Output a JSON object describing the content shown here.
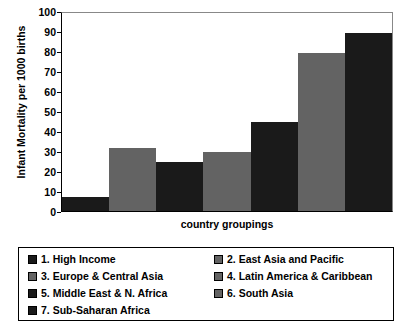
{
  "chart_data": {
    "type": "bar",
    "title": "",
    "xlabel": "country groupings",
    "ylabel": "Infant Mortality per 1000 births",
    "ylim": [
      0,
      100
    ],
    "ytick_step": 10,
    "yticks": [
      100,
      90,
      80,
      70,
      60,
      50,
      40,
      30,
      20,
      10,
      0
    ],
    "grid": false,
    "legend_position": "bottom",
    "categories": [
      "1. High Income",
      "2. East Asia and Pacific",
      "3. Europe & Central Asia",
      "4. Latin America & Caribbean",
      "5. Middle East & N. Africa",
      "6. South Asia",
      "7. Sub-Saharan Africa"
    ],
    "values": [
      7,
      32,
      25,
      30,
      45,
      80,
      90
    ],
    "bar_colors": [
      "#1a1a1a",
      "#636363",
      "#1a1a1a",
      "#636363",
      "#1a1a1a",
      "#636363",
      "#1a1a1a"
    ]
  },
  "legend": {
    "items": [
      {
        "label": "1. High Income",
        "color": "#1a1a1a"
      },
      {
        "label": "2. East Asia and Pacific",
        "color": "#636363"
      },
      {
        "label": "3. Europe & Central Asia",
        "color": "#636363"
      },
      {
        "label": "4. Latin America & Caribbean",
        "color": "#636363"
      },
      {
        "label": "5. Middle East & N. Africa",
        "color": "#1a1a1a"
      },
      {
        "label": "6. South Asia",
        "color": "#636363"
      },
      {
        "label": "7. Sub-Saharan Africa",
        "color": "#1a1a1a"
      }
    ]
  }
}
